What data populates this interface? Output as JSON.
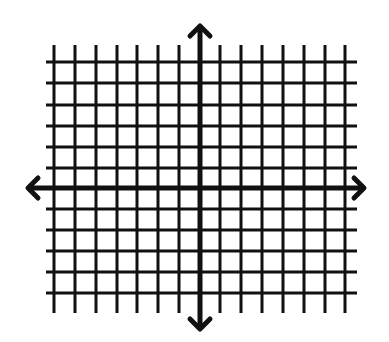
{
  "diagram": {
    "colors": {
      "background": "#ffffff",
      "lines": "#111111"
    },
    "grid": {
      "vertical_lines_x": [
        54,
        75,
        96,
        117,
        137,
        158,
        179,
        220,
        241,
        262,
        283,
        304,
        325,
        345
      ],
      "vertical_span_y": [
        45,
        313
      ],
      "horizontal_lines_y": [
        62,
        83,
        105,
        126,
        147,
        168,
        209,
        230,
        251,
        272,
        293
      ],
      "horizontal_span_x": [
        46,
        357
      ],
      "stroke_width": 3
    },
    "x_axis": {
      "y": 188,
      "from_x": 28,
      "to_x": 364,
      "stroke_width": 5,
      "arrows": "both"
    },
    "y_axis": {
      "x": 200,
      "from_y": 26,
      "to_y": 329,
      "stroke_width": 5,
      "arrows": "both"
    },
    "labels": []
  }
}
